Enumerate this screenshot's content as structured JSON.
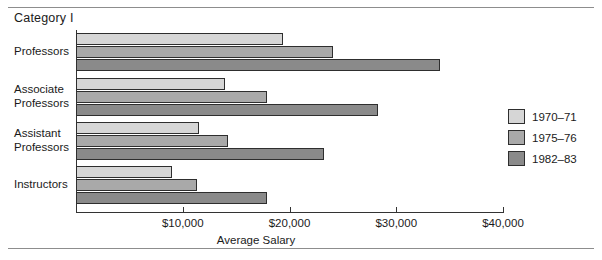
{
  "figure": {
    "title": "Category I",
    "has_top_rule": true,
    "has_bottom_rule": true
  },
  "chart_data": {
    "type": "bar",
    "orientation": "horizontal",
    "title": "Category I",
    "xlabel": "Average Salary",
    "ylabel": "",
    "xlim": [
      0,
      40000
    ],
    "xticks": [
      10000,
      20000,
      30000,
      40000
    ],
    "xtick_labels": [
      "$10,000",
      "$20,000",
      "$30,000",
      "$40,000"
    ],
    "grid": false,
    "legend_position": "right",
    "categories": [
      "Professors",
      "Associate Professors",
      "Assistant Professors",
      "Instructors"
    ],
    "category_label_lines": [
      [
        "Professors"
      ],
      [
        "Associate",
        "Professors"
      ],
      [
        "Assistant",
        "Professors"
      ],
      [
        "Instructors"
      ]
    ],
    "series": [
      {
        "name": "1970-71",
        "color": "#d6d6d6",
        "values": [
          19400,
          14000,
          11500,
          9000
        ]
      },
      {
        "name": "1975-76",
        "color": "#a9a9a9",
        "values": [
          24100,
          17900,
          14200,
          11300
        ]
      },
      {
        "name": "1982-83",
        "color": "#8a8a8a",
        "values": [
          34100,
          28300,
          23200,
          17900
        ]
      }
    ]
  },
  "legend": {
    "items": [
      {
        "label": "1970–71",
        "color": "#d6d6d6"
      },
      {
        "label": "1975–76",
        "color": "#a9a9a9"
      },
      {
        "label": "1982–83",
        "color": "#8a8a8a"
      }
    ]
  },
  "axis": {
    "title": "Average Salary",
    "ticks": [
      {
        "label": "$10,000",
        "value": 10000
      },
      {
        "label": "$20,000",
        "value": 20000
      },
      {
        "label": "$30,000",
        "value": 30000
      },
      {
        "label": "$40,000",
        "value": 40000
      }
    ]
  }
}
